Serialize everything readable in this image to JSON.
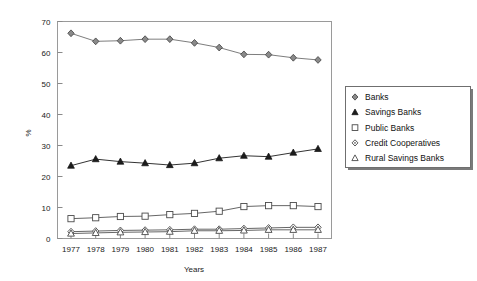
{
  "chart_data": {
    "type": "line",
    "title": "",
    "xlabel": "Years",
    "ylabel": "%",
    "xlim": [
      1977,
      1987
    ],
    "ylim": [
      0,
      70
    ],
    "ytick_labels": [
      "0",
      "10",
      "20",
      "30",
      "40",
      "50",
      "60",
      "70"
    ],
    "ytick_values": [
      0,
      10,
      20,
      30,
      40,
      50,
      60,
      70
    ],
    "grid": false,
    "legend_position": "right",
    "categories": [
      "1977",
      "1978",
      "1979",
      "1980",
      "1981",
      "1982",
      "1983",
      "1984",
      "1985",
      "1986",
      "1987"
    ],
    "x": [
      1977,
      1978,
      1979,
      1980,
      1981,
      1982,
      1983,
      1984,
      1985,
      1986,
      1987
    ],
    "series": [
      {
        "name": "Banks",
        "marker": "filled-diamond",
        "color": "#6e6e6e",
        "values": [
          66.2,
          63.6,
          63.8,
          64.3,
          64.3,
          63.1,
          61.6,
          59.4,
          59.3,
          58.3,
          57.6
        ]
      },
      {
        "name": "Savings Banks",
        "marker": "filled-triangle",
        "color": "#1c1c1c",
        "values": [
          23.5,
          25.6,
          24.8,
          24.3,
          23.7,
          24.3,
          25.9,
          26.7,
          26.4,
          27.7,
          28.9
        ]
      },
      {
        "name": "Public Banks",
        "marker": "open-square",
        "color": "#555555",
        "values": [
          6.4,
          6.7,
          7.1,
          7.2,
          7.7,
          8.1,
          8.8,
          10.3,
          10.6,
          10.6,
          10.3
        ]
      },
      {
        "name": "Credit Cooperatives",
        "marker": "open-diamond",
        "color": "#555555",
        "values": [
          2.2,
          2.4,
          2.6,
          2.7,
          2.8,
          3.0,
          3.0,
          3.2,
          3.4,
          3.6,
          3.6
        ]
      },
      {
        "name": "Rural Savings Banks",
        "marker": "open-triangle",
        "color": "#555555",
        "values": [
          1.6,
          1.8,
          2.0,
          2.1,
          2.2,
          2.5,
          2.5,
          2.6,
          2.8,
          2.8,
          2.8
        ]
      }
    ]
  },
  "legend": {
    "items": [
      {
        "label": "Banks"
      },
      {
        "label": "Savings Banks"
      },
      {
        "label": "Public Banks"
      },
      {
        "label": "Credit Cooperatives"
      },
      {
        "label": "Rural Savings Banks"
      }
    ]
  },
  "axes": {
    "y_title": "%",
    "x_title": "Years"
  }
}
